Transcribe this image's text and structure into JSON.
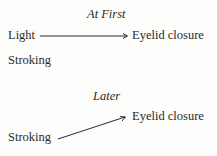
{
  "diagram": {
    "panels": [
      {
        "heading": "At First",
        "stimuli": [
          "Light",
          "Stroking"
        ],
        "response": "Eyelid closure",
        "connections": [
          {
            "from": "Light",
            "to": "Eyelid closure"
          }
        ]
      },
      {
        "heading": "Later",
        "stimuli": [
          "Stroking"
        ],
        "response": "Eyelid closure",
        "connections": [
          {
            "from": "Stroking",
            "to": "Eyelid closure"
          }
        ]
      }
    ]
  }
}
